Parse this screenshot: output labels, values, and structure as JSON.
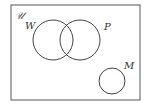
{
  "diagram": {
    "type": "venn",
    "universe": {
      "label": "𝒰"
    },
    "sets": [
      {
        "label": "W"
      },
      {
        "label": "P"
      },
      {
        "label": "M"
      }
    ]
  }
}
